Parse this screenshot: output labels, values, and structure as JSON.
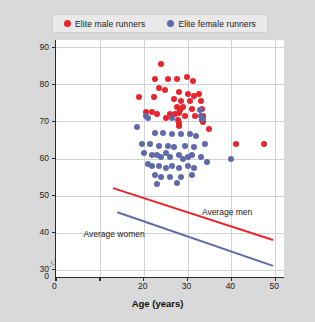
{
  "legend": {
    "entries": [
      {
        "label": "Elite male runners",
        "color": "#e8252c",
        "key": "male"
      },
      {
        "label": "Elite female runners",
        "color": "#5f6aa8",
        "key": "female"
      }
    ]
  },
  "axes": {
    "y_label_main": "VO",
    "y_label_sub": "2max",
    "y_label_units_open": " (ml · kg",
    "y_label_sup1": "-1",
    "y_label_mid": " · min",
    "y_label_sup2": "-1",
    "y_label_close": ")",
    "x_label": "Age (years)",
    "y_ticks": [
      "0",
      "30",
      "40",
      "50",
      "60",
      "70",
      "80",
      "90"
    ],
    "x_ticks": [
      "0",
      "20",
      "30",
      "40",
      "50"
    ],
    "x_origin_label": "0"
  },
  "annotations": {
    "average_men": "Average men",
    "average_women": "Average women"
  },
  "chart_data": {
    "type": "scatter",
    "title": "",
    "xlabel": "Age (years)",
    "ylabel": "VO2max (ml · kg-1 · min-1)",
    "xlim": [
      0,
      52
    ],
    "ylim": [
      28,
      92
    ],
    "y_axis_break": true,
    "y_axis_break_between": [
      0,
      30
    ],
    "grid": true,
    "legend_position": "top",
    "x_tick_values": [
      0,
      10,
      20,
      30,
      40,
      50
    ],
    "x_tick_labels_shown": [
      0,
      20,
      30,
      40,
      50
    ],
    "y_tick_values": [
      30,
      40,
      50,
      60,
      70,
      80,
      90
    ],
    "series": [
      {
        "name": "Elite male runners",
        "color": "#e8252c",
        "points": [
          [
            24.0,
            85.5
          ],
          [
            22.5,
            81.5
          ],
          [
            25.5,
            81.5
          ],
          [
            27.5,
            81.5
          ],
          [
            29.8,
            82.0
          ],
          [
            31.3,
            81.0
          ],
          [
            23.5,
            79.0
          ],
          [
            24.8,
            78.5
          ],
          [
            28.0,
            78.0
          ],
          [
            30.0,
            77.5
          ],
          [
            31.5,
            77.0
          ],
          [
            32.5,
            77.5
          ],
          [
            19.0,
            76.5
          ],
          [
            22.3,
            76.5
          ],
          [
            26.8,
            76.0
          ],
          [
            28.5,
            75.5
          ],
          [
            30.5,
            75.5
          ],
          [
            33.0,
            75.5
          ],
          [
            27.6,
            74.0
          ],
          [
            29.0,
            74.0
          ],
          [
            31.0,
            73.5
          ],
          [
            33.2,
            73.5
          ],
          [
            20.5,
            72.5
          ],
          [
            21.8,
            72.5
          ],
          [
            23.0,
            72.0
          ],
          [
            26.0,
            72.0
          ],
          [
            27.2,
            72.0
          ],
          [
            29.5,
            71.5
          ],
          [
            31.8,
            71.5
          ],
          [
            33.5,
            71.5
          ],
          [
            25.0,
            71.0
          ],
          [
            27.9,
            70.5
          ],
          [
            28.0,
            69.5
          ],
          [
            28.0,
            68.8
          ],
          [
            28.1,
            72.3
          ],
          [
            28.2,
            73.2
          ],
          [
            33.4,
            70.5
          ],
          [
            33.6,
            69.8
          ],
          [
            34.8,
            68.0
          ],
          [
            41.0,
            64.0
          ],
          [
            47.5,
            64.0
          ]
        ]
      },
      {
        "name": "Elite female runners",
        "color": "#5f6aa8",
        "points": [
          [
            20.5,
            71.5
          ],
          [
            21.0,
            71.0
          ],
          [
            26.5,
            71.0
          ],
          [
            32.8,
            73.0
          ],
          [
            33.0,
            71.5
          ],
          [
            33.6,
            70.8
          ],
          [
            18.5,
            68.5
          ],
          [
            22.5,
            67.0
          ],
          [
            24.5,
            67.0
          ],
          [
            26.5,
            66.5
          ],
          [
            28.5,
            66.5
          ],
          [
            30.5,
            66.5
          ],
          [
            32.0,
            66.0
          ],
          [
            19.5,
            64.0
          ],
          [
            21.5,
            64.0
          ],
          [
            23.5,
            63.5
          ],
          [
            25.5,
            63.5
          ],
          [
            27.0,
            63.0
          ],
          [
            29.5,
            63.5
          ],
          [
            31.5,
            63.0
          ],
          [
            34.0,
            64.0
          ],
          [
            20.0,
            61.5
          ],
          [
            22.0,
            61.0
          ],
          [
            23.0,
            61.0
          ],
          [
            24.0,
            60.5
          ],
          [
            25.0,
            61.5
          ],
          [
            26.0,
            60.5
          ],
          [
            28.0,
            61.0
          ],
          [
            29.0,
            60.0
          ],
          [
            30.0,
            60.5
          ],
          [
            31.0,
            61.0
          ],
          [
            33.0,
            60.5
          ],
          [
            21.0,
            58.5
          ],
          [
            22.0,
            58.0
          ],
          [
            23.5,
            58.0
          ],
          [
            25.0,
            57.5
          ],
          [
            26.5,
            58.0
          ],
          [
            28.0,
            57.5
          ],
          [
            30.0,
            58.0
          ],
          [
            31.5,
            57.5
          ],
          [
            34.5,
            59.0
          ],
          [
            22.5,
            55.5
          ],
          [
            24.0,
            55.0
          ],
          [
            26.0,
            55.0
          ],
          [
            28.5,
            55.0
          ],
          [
            31.0,
            55.5
          ],
          [
            23.0,
            53.0
          ],
          [
            27.5,
            53.5
          ],
          [
            40.0,
            60.0
          ]
        ]
      }
    ],
    "trend_lines": [
      {
        "name": "Average men",
        "color": "#e8252c",
        "x": [
          13.0,
          49.5
        ],
        "y": [
          52.0,
          38.0
        ]
      },
      {
        "name": "Average women",
        "color": "#5f6aa8",
        "x": [
          14.0,
          49.5
        ],
        "y": [
          45.5,
          31.0
        ]
      }
    ]
  }
}
